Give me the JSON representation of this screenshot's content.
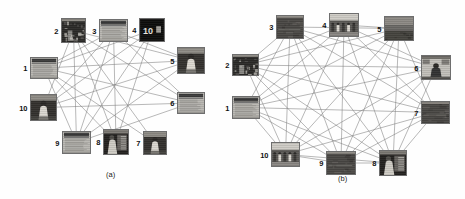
{
  "figure": {
    "type": "two-panel-graph-figure",
    "background_color": "#fefefe",
    "edge_color": "#7d7d7d",
    "label_color": "#111111",
    "width": 465,
    "height": 199
  },
  "panels": [
    {
      "id": "a",
      "caption": "(a)",
      "caption_x": 106,
      "caption_y": 170,
      "node_count": 10,
      "nodes": [
        {
          "label": "1",
          "x": 30,
          "y": 57,
          "w": 28,
          "h": 22,
          "label_pos": "left",
          "thumb": "document-page-grayscale",
          "desc": "scanned text document with dark header bar"
        },
        {
          "label": "2",
          "x": 61,
          "y": 18,
          "w": 25,
          "h": 25,
          "label_pos": "left",
          "thumb": "dark-foliage-scene",
          "desc": "dark outdoor scene with branches"
        },
        {
          "label": "3",
          "x": 99,
          "y": 19,
          "w": 29,
          "h": 23,
          "label_pos": "left",
          "thumb": "document-page-grayscale",
          "desc": "document page with dark top band"
        },
        {
          "label": "4",
          "x": 139,
          "y": 18,
          "w": 26,
          "h": 24,
          "label_pos": "left",
          "thumb": "dark-sign-with-text",
          "desc": "very dark image with bright numerals"
        },
        {
          "label": "5",
          "x": 177,
          "y": 47,
          "w": 28,
          "h": 27,
          "label_pos": "left",
          "thumb": "person-light-subject",
          "desc": "dark scene with light-clothed figure"
        },
        {
          "label": "6",
          "x": 177,
          "y": 92,
          "w": 28,
          "h": 22,
          "label_pos": "left",
          "thumb": "document-page-grayscale",
          "desc": "plain mid-gray document page"
        },
        {
          "label": "7",
          "x": 143,
          "y": 131,
          "w": 24,
          "h": 24,
          "label_pos": "left",
          "thumb": "person-light-subject",
          "desc": "figure in light garment"
        },
        {
          "label": "8",
          "x": 103,
          "y": 129,
          "w": 26,
          "h": 26,
          "label_pos": "left",
          "thumb": "dark-indoor-figure",
          "desc": "dark indoor scene with standing figure"
        },
        {
          "label": "9",
          "x": 62,
          "y": 131,
          "w": 29,
          "h": 23,
          "label_pos": "left",
          "thumb": "document-page-grayscale",
          "desc": "document page, light gray body"
        },
        {
          "label": "10",
          "x": 30,
          "y": 94,
          "w": 27,
          "h": 27,
          "label_pos": "left",
          "thumb": "person-light-subject",
          "desc": "dark frame, bright figure in center"
        }
      ],
      "edges": [
        [
          "1",
          "3"
        ],
        [
          "1",
          "4"
        ],
        [
          "1",
          "5"
        ],
        [
          "1",
          "6"
        ],
        [
          "1",
          "7"
        ],
        [
          "1",
          "8"
        ],
        [
          "1",
          "9"
        ],
        [
          "2",
          "5"
        ],
        [
          "2",
          "6"
        ],
        [
          "2",
          "7"
        ],
        [
          "2",
          "8"
        ],
        [
          "2",
          "9"
        ],
        [
          "3",
          "5"
        ],
        [
          "3",
          "6"
        ],
        [
          "3",
          "8"
        ],
        [
          "3",
          "9"
        ],
        [
          "3",
          "10"
        ],
        [
          "4",
          "8"
        ],
        [
          "4",
          "9"
        ],
        [
          "4",
          "10"
        ],
        [
          "5",
          "10"
        ],
        [
          "5",
          "9"
        ],
        [
          "6",
          "10"
        ],
        [
          "6",
          "9"
        ],
        [
          "2",
          "10"
        ]
      ]
    },
    {
      "id": "b",
      "caption": "(b)",
      "caption_x": 338,
      "caption_y": 174,
      "node_count": 10,
      "nodes": [
        {
          "label": "1",
          "x": 232,
          "y": 96,
          "w": 28,
          "h": 23,
          "label_pos": "left",
          "thumb": "document-page-grayscale",
          "desc": "light gray document page"
        },
        {
          "label": "2",
          "x": 232,
          "y": 54,
          "w": 27,
          "h": 22,
          "label_pos": "left",
          "thumb": "dark-foliage-scene",
          "desc": "dark scene with bright top strip"
        },
        {
          "label": "3",
          "x": 276,
          "y": 15,
          "w": 28,
          "h": 24,
          "label_pos": "left",
          "thumb": "dark-flat-scene",
          "desc": "dark flat field image"
        },
        {
          "label": "4",
          "x": 329,
          "y": 13,
          "w": 30,
          "h": 24,
          "label_pos": "left",
          "thumb": "group-outdoor-scene",
          "desc": "outdoor scene with several people"
        },
        {
          "label": "5",
          "x": 384,
          "y": 16,
          "w": 30,
          "h": 25,
          "label_pos": "left",
          "thumb": "landscape-sky-scene",
          "desc": "landscape with lighter sky band"
        },
        {
          "label": "6",
          "x": 421,
          "y": 55,
          "w": 30,
          "h": 25,
          "label_pos": "left",
          "thumb": "seated-person-indoor",
          "desc": "person seated indoors, light wall"
        },
        {
          "label": "7",
          "x": 421,
          "y": 101,
          "w": 29,
          "h": 23,
          "label_pos": "left",
          "thumb": "dark-flat-scene",
          "desc": "dark image with faint light streak"
        },
        {
          "label": "8",
          "x": 379,
          "y": 150,
          "w": 28,
          "h": 26,
          "label_pos": "left",
          "thumb": "dark-indoor-figure",
          "desc": "dark indoor scene with figures"
        },
        {
          "label": "9",
          "x": 326,
          "y": 151,
          "w": 30,
          "h": 24,
          "label_pos": "left",
          "thumb": "dark-flat-scene",
          "desc": "dark flat field image"
        },
        {
          "label": "10",
          "x": 271,
          "y": 142,
          "w": 29,
          "h": 25,
          "label_pos": "left",
          "thumb": "group-outdoor-scene",
          "desc": "outdoor scene with people and vehicle"
        }
      ],
      "edges": [
        [
          "1",
          "3"
        ],
        [
          "1",
          "4"
        ],
        [
          "1",
          "5"
        ],
        [
          "1",
          "6"
        ],
        [
          "1",
          "7"
        ],
        [
          "1",
          "8"
        ],
        [
          "1",
          "9"
        ],
        [
          "1",
          "10"
        ],
        [
          "2",
          "4"
        ],
        [
          "2",
          "5"
        ],
        [
          "2",
          "6"
        ],
        [
          "2",
          "7"
        ],
        [
          "2",
          "8"
        ],
        [
          "2",
          "9"
        ],
        [
          "2",
          "10"
        ],
        [
          "2",
          "3"
        ],
        [
          "3",
          "5"
        ],
        [
          "3",
          "6"
        ],
        [
          "3",
          "7"
        ],
        [
          "3",
          "8"
        ],
        [
          "3",
          "9"
        ],
        [
          "3",
          "10"
        ],
        [
          "4",
          "6"
        ],
        [
          "4",
          "7"
        ],
        [
          "4",
          "8"
        ],
        [
          "4",
          "9"
        ],
        [
          "4",
          "10"
        ],
        [
          "4",
          "5"
        ],
        [
          "5",
          "7"
        ],
        [
          "5",
          "8"
        ],
        [
          "5",
          "9"
        ],
        [
          "5",
          "10"
        ],
        [
          "6",
          "8"
        ],
        [
          "6",
          "9"
        ],
        [
          "6",
          "10"
        ],
        [
          "7",
          "9"
        ],
        [
          "7",
          "10"
        ],
        [
          "7",
          "8"
        ],
        [
          "8",
          "10"
        ],
        [
          "8",
          "9"
        ],
        [
          "9",
          "10"
        ]
      ]
    }
  ]
}
